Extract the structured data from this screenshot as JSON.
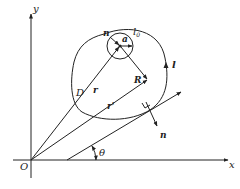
{
  "diagram": {
    "axes": {
      "x_label": "x",
      "y_label": "y",
      "origin_label": "O"
    },
    "labels": {
      "domain": "D",
      "outer_boundary": "l",
      "inner_boundary": "l",
      "inner_boundary_sub": "0",
      "inner_normal": "n",
      "radius": "a",
      "position_vector": "r",
      "position_vector_prime": "r'",
      "relative_vector": "R",
      "outer_normal": "n",
      "angle": "θ"
    },
    "colors": {
      "stroke": "#222222",
      "background": "#ffffff"
    }
  }
}
